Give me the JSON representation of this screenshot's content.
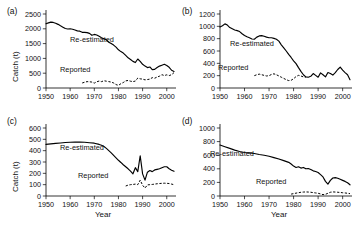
{
  "figure": {
    "width": 355,
    "height": 228,
    "background": "#ffffff",
    "ink_color": "#000000"
  },
  "labels": {
    "panel_a": "(a)",
    "panel_b": "(b)",
    "panel_c": "(c)",
    "panel_d": "(d)",
    "ylabel": "Catch (t)",
    "xlabel": "Year",
    "series_reestimated": "Re-estimated",
    "series_reported": "Reported"
  },
  "chart_data": [
    {
      "id": "a",
      "type": "line",
      "title": "(a)",
      "xlabel": "",
      "ylabel": "Catch (t)",
      "xlim": [
        1950,
        2003
      ],
      "ylim": [
        0,
        2500
      ],
      "xticks": [
        1950,
        1960,
        1970,
        1980,
        1990,
        2000
      ],
      "yticks": [
        0,
        500,
        1000,
        1500,
        2000,
        2500
      ],
      "grid": false,
      "legend": "inline-annotation",
      "series": [
        {
          "name": "Re-estimated",
          "style": "solid",
          "x": [
            1950,
            1951,
            1952,
            1953,
            1954,
            1955,
            1956,
            1957,
            1958,
            1959,
            1960,
            1961,
            1962,
            1963,
            1964,
            1965,
            1966,
            1967,
            1968,
            1969,
            1970,
            1971,
            1972,
            1973,
            1974,
            1975,
            1976,
            1977,
            1978,
            1979,
            1980,
            1981,
            1982,
            1983,
            1984,
            1985,
            1986,
            1987,
            1988,
            1989,
            1990,
            1991,
            1992,
            1993,
            1994,
            1995,
            1996,
            1997,
            1998,
            1999,
            2000,
            2001,
            2002,
            2003
          ],
          "values": [
            2170,
            2200,
            2225,
            2215,
            2190,
            2150,
            2100,
            2055,
            2010,
            1995,
            2000,
            1985,
            1960,
            1930,
            1920,
            1880,
            1880,
            1870,
            1845,
            1780,
            1810,
            1790,
            1745,
            1700,
            1660,
            1630,
            1545,
            1500,
            1450,
            1380,
            1290,
            1230,
            1180,
            1100,
            1020,
            965,
            900,
            860,
            980,
            900,
            800,
            740,
            690,
            710,
            620,
            630,
            690,
            740,
            770,
            800,
            760,
            700,
            600,
            560
          ]
        },
        {
          "name": "Reported",
          "style": "dashed",
          "x": [
            1965,
            1966,
            1967,
            1968,
            1969,
            1970,
            1971,
            1972,
            1973,
            1974,
            1975,
            1976,
            1977,
            1978,
            1979,
            1980,
            1981,
            1982,
            1983,
            1984,
            1985,
            1986,
            1987,
            1988,
            1989,
            1990,
            1991,
            1992,
            1993,
            1994,
            1995,
            1996,
            1997,
            1998,
            1999,
            2000,
            2001,
            2002,
            2003
          ],
          "values": [
            170,
            195,
            215,
            210,
            200,
            165,
            210,
            235,
            215,
            245,
            230,
            215,
            200,
            170,
            115,
            90,
            145,
            185,
            240,
            255,
            230,
            215,
            235,
            335,
            310,
            300,
            275,
            285,
            300,
            350,
            330,
            370,
            400,
            450,
            420,
            445,
            420,
            450,
            520
          ]
        }
      ]
    },
    {
      "id": "b",
      "type": "line",
      "title": "(b)",
      "xlabel": "",
      "ylabel": "",
      "xlim": [
        1950,
        2003
      ],
      "ylim": [
        0,
        1200
      ],
      "xticks": [
        1950,
        1960,
        1970,
        1980,
        1990,
        2000
      ],
      "yticks": [
        0,
        200,
        400,
        600,
        800,
        1000,
        1200
      ],
      "grid": false,
      "legend": "inline-annotation",
      "series": [
        {
          "name": "Re-estimated",
          "style": "solid",
          "x": [
            1950,
            1951,
            1952,
            1953,
            1954,
            1955,
            1956,
            1957,
            1958,
            1959,
            1960,
            1961,
            1962,
            1963,
            1964,
            1965,
            1966,
            1967,
            1968,
            1969,
            1970,
            1971,
            1972,
            1973,
            1974,
            1975,
            1976,
            1977,
            1978,
            1979,
            1980,
            1981,
            1982,
            1983,
            1984,
            1985,
            1986,
            1987,
            1988,
            1989,
            1990,
            1991,
            1992,
            1993,
            1994,
            1995,
            1996,
            1997,
            1998,
            1999,
            2000,
            2001,
            2002,
            2003
          ],
          "values": [
            990,
            1010,
            1040,
            1020,
            980,
            960,
            940,
            930,
            915,
            880,
            850,
            830,
            815,
            795,
            790,
            825,
            845,
            850,
            840,
            825,
            815,
            815,
            805,
            790,
            760,
            700,
            650,
            600,
            545,
            495,
            440,
            395,
            330,
            270,
            215,
            180,
            175,
            190,
            235,
            205,
            175,
            245,
            215,
            180,
            250,
            235,
            210,
            250,
            300,
            340,
            290,
            250,
            215,
            135
          ]
        },
        {
          "name": "Reported",
          "style": "dashed",
          "x": [
            1964,
            1965,
            1966,
            1967,
            1968,
            1969,
            1970,
            1971,
            1972,
            1973,
            1974,
            1975,
            1976,
            1977,
            1978,
            1979,
            1980,
            1981,
            1982,
            1983,
            1984,
            1985
          ],
          "values": [
            200,
            215,
            225,
            215,
            205,
            195,
            200,
            220,
            230,
            215,
            195,
            175,
            155,
            135,
            120,
            125,
            150,
            185,
            205,
            195,
            180,
            175
          ]
        }
      ]
    },
    {
      "id": "c",
      "type": "line",
      "title": "(c)",
      "xlabel": "Year",
      "ylabel": "Catch (t)",
      "xlim": [
        1950,
        2003
      ],
      "ylim": [
        0,
        600
      ],
      "xticks": [
        1950,
        1960,
        1970,
        1980,
        1990,
        2000
      ],
      "yticks": [
        0,
        100,
        200,
        300,
        400,
        500,
        600
      ],
      "grid": false,
      "legend": "inline-annotation",
      "series": [
        {
          "name": "Re-estimated",
          "style": "solid",
          "x": [
            1950,
            1952,
            1954,
            1956,
            1958,
            1960,
            1962,
            1964,
            1966,
            1968,
            1970,
            1972,
            1973,
            1974,
            1975,
            1976,
            1977,
            1978,
            1979,
            1980,
            1981,
            1982,
            1983,
            1984,
            1985,
            1986,
            1987,
            1988,
            1989,
            1990,
            1991,
            1992,
            1993,
            1994,
            1995,
            1996,
            1997,
            1998,
            1999,
            2000,
            2001,
            2002,
            2003
          ],
          "values": [
            455,
            460,
            464,
            468,
            472,
            474,
            476,
            476,
            474,
            470,
            466,
            455,
            448,
            437,
            420,
            400,
            380,
            358,
            336,
            315,
            296,
            276,
            258,
            240,
            220,
            196,
            250,
            215,
            355,
            195,
            140,
            210,
            225,
            215,
            230,
            235,
            240,
            250,
            258,
            258,
            240,
            228,
            218
          ]
        },
        {
          "name": "Reported",
          "style": "dashed",
          "x": [
            1983,
            1984,
            1985,
            1986,
            1987,
            1988,
            1989,
            1990,
            1991,
            1992,
            1993,
            1994,
            1995,
            1996,
            1997,
            1998,
            1999,
            2000,
            2001,
            2002,
            2003
          ],
          "values": [
            88,
            96,
            100,
            102,
            105,
            100,
            140,
            95,
            70,
            98,
            100,
            102,
            105,
            108,
            110,
            112,
            113,
            112,
            110,
            105,
            100
          ]
        }
      ]
    },
    {
      "id": "d",
      "type": "line",
      "title": "(d)",
      "xlabel": "Year",
      "ylabel": "",
      "xlim": [
        1950,
        2003
      ],
      "ylim": [
        0,
        1000
      ],
      "xticks": [
        1950,
        1960,
        1970,
        1980,
        1990,
        2000
      ],
      "yticks": [
        0,
        200,
        400,
        600,
        800,
        1000
      ],
      "grid": false,
      "legend": "inline-annotation",
      "series": [
        {
          "name": "Re-estimated",
          "style": "solid",
          "x": [
            1950,
            1952,
            1954,
            1956,
            1958,
            1960,
            1962,
            1964,
            1966,
            1968,
            1970,
            1972,
            1974,
            1976,
            1978,
            1979,
            1980,
            1981,
            1982,
            1983,
            1984,
            1985,
            1986,
            1987,
            1988,
            1989,
            1990,
            1991,
            1992,
            1993,
            1994,
            1995,
            1996,
            1997,
            1998,
            1999,
            2000,
            2001,
            2002,
            2003
          ],
          "values": [
            750,
            725,
            700,
            675,
            655,
            640,
            635,
            625,
            610,
            600,
            585,
            565,
            545,
            520,
            495,
            470,
            440,
            420,
            430,
            410,
            420,
            400,
            405,
            390,
            370,
            360,
            345,
            315,
            280,
            215,
            175,
            230,
            265,
            270,
            260,
            245,
            230,
            215,
            195,
            165
          ]
        },
        {
          "name": "Reported",
          "style": "dashed",
          "x": [
            1979,
            1980,
            1981,
            1982,
            1983,
            1984,
            1985,
            1986,
            1987,
            1988,
            1989,
            1990,
            1991,
            1992,
            1993,
            1994,
            1995,
            1996,
            1997,
            1998,
            1999,
            2000,
            2001,
            2002,
            2003
          ],
          "values": [
            28,
            35,
            42,
            48,
            55,
            58,
            60,
            58,
            55,
            50,
            45,
            40,
            30,
            20,
            25,
            40,
            55,
            60,
            58,
            55,
            52,
            48,
            45,
            40,
            35
          ]
        }
      ]
    }
  ]
}
